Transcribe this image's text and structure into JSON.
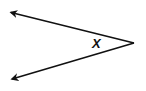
{
  "diagram": {
    "type": "angle",
    "angle_label": "X",
    "vertex": [
      134,
      43
    ],
    "rays": [
      {
        "name": "upper-ray",
        "end": [
          9,
          12
        ]
      },
      {
        "name": "lower-ray",
        "end": [
          10,
          80
        ]
      }
    ],
    "stroke_color": "#111111",
    "background": "#ffffff"
  }
}
